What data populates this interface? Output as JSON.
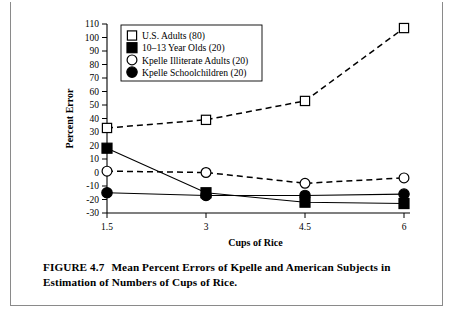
{
  "figure": {
    "caption_head": "FIGURE  4.7",
    "caption_text": "Mean Percent Errors of Kpelle and American Subjects in Estimation of Numbers of Cups of Rice."
  },
  "chart_data": {
    "type": "line",
    "title": "",
    "xlabel": "Cups of Rice",
    "ylabel": "Percent Error",
    "categories": [
      "1.5",
      "3",
      "4.5",
      "6"
    ],
    "x": [
      1.5,
      3,
      4.5,
      6
    ],
    "xlim": [
      1.5,
      6
    ],
    "ylim": [
      -30,
      110
    ],
    "ytick_step": 10,
    "yticks": [
      110,
      100,
      90,
      80,
      70,
      60,
      50,
      40,
      30,
      20,
      10,
      0,
      -10,
      -20,
      -30
    ],
    "ytick_labels": [
      "110",
      "100",
      "90",
      "80",
      "70",
      "60",
      "50",
      "40",
      "30",
      "20",
      "10",
      "0",
      "-10",
      "-20",
      "-30"
    ],
    "xticks": [
      1.5,
      3,
      4.5,
      6
    ],
    "xtick_labels": [
      "1.5",
      "3",
      "4.5",
      "6"
    ],
    "grid": false,
    "legend_position": "top-left",
    "series": [
      {
        "name": "U.S. Adults (80)",
        "marker": "open-square",
        "linestyle": "dashed",
        "color": "#000000",
        "values": [
          33,
          39,
          53,
          107
        ]
      },
      {
        "name": "10–13 Year Olds (20)",
        "marker": "filled-square",
        "linestyle": "solid",
        "color": "#000000",
        "values": [
          18,
          -15,
          -22,
          -23
        ]
      },
      {
        "name": "Kpelle Illiterate Adults (20)",
        "marker": "open-circle",
        "linestyle": "dashed",
        "color": "#000000",
        "values": [
          1,
          0,
          -8,
          -4
        ]
      },
      {
        "name": "Kpelle Schoolchildren (20)",
        "marker": "filled-circle",
        "linestyle": "solid",
        "color": "#000000",
        "values": [
          -15,
          -17,
          -17,
          -16
        ]
      }
    ]
  }
}
